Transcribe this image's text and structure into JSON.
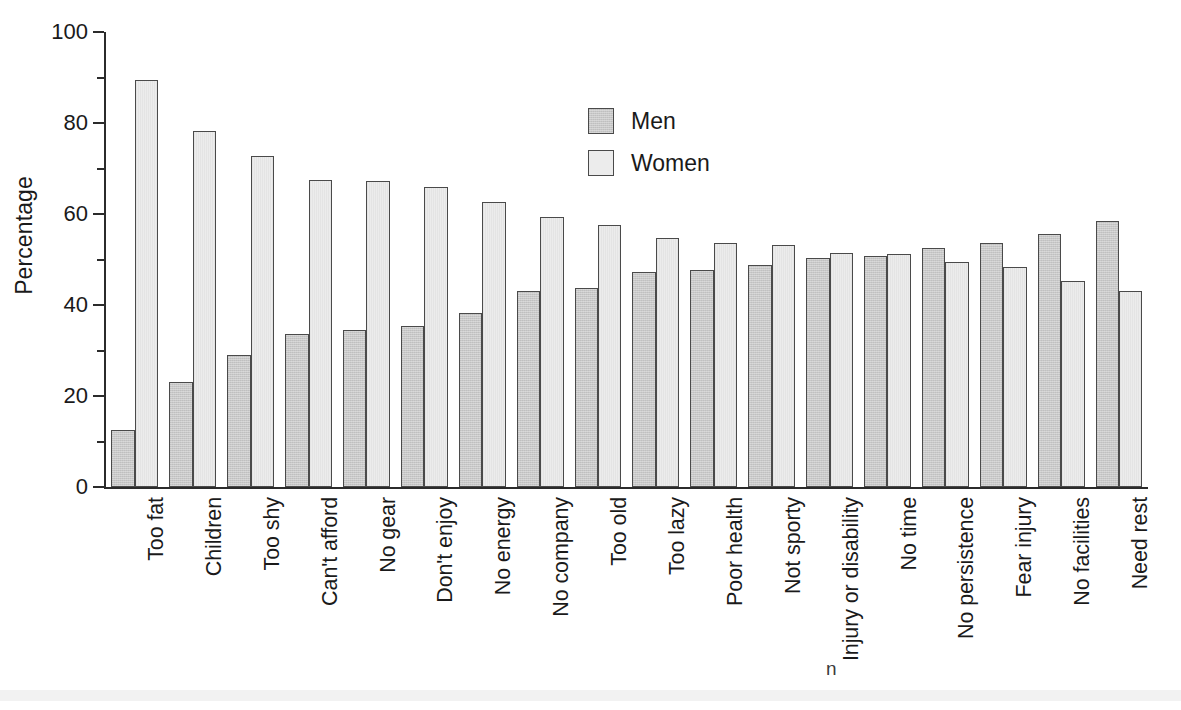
{
  "chart_data": {
    "type": "bar",
    "title": "",
    "subtitle": "",
    "xlabel": "",
    "ylabel": "Percentage",
    "ylim": [
      0,
      100
    ],
    "y_major_ticks": [
      0,
      20,
      40,
      60,
      80,
      100
    ],
    "y_minor_ticks": [
      10,
      30,
      50,
      70,
      90
    ],
    "y_tick_labels": [
      "0",
      "20",
      "40",
      "60",
      "80",
      "100"
    ],
    "grid": false,
    "legend_position": "inside-top-center",
    "orientation": "vertical",
    "grouping": "grouped",
    "categories": [
      "Too fat",
      "Children",
      "Too shy",
      "Can't afford",
      "No gear",
      "Don't enjoy",
      "No energy",
      "No company",
      "Too old",
      "Too lazy",
      "Poor health",
      "Not sporty",
      "Injury or disability",
      "No time",
      "No persistence",
      "Fear injury",
      "No facilities",
      "Need rest"
    ],
    "series": [
      {
        "name": "Men",
        "color": "#c8c8c8",
        "values": [
          12.6,
          23.0,
          29.0,
          33.6,
          34.4,
          35.3,
          38.2,
          43.1,
          43.7,
          47.2,
          47.7,
          48.8,
          50.3,
          50.7,
          52.5,
          53.7,
          55.7,
          58.4
        ]
      },
      {
        "name": "Women",
        "color": "#ececec",
        "values": [
          89.4,
          78.3,
          72.7,
          67.4,
          67.2,
          66.0,
          62.7,
          59.3,
          57.5,
          54.8,
          53.7,
          53.1,
          51.4,
          51.2,
          49.5,
          48.4,
          45.3,
          43.1
        ]
      }
    ],
    "annotations": []
  },
  "legend": {
    "items": [
      {
        "label": "Men",
        "swatch": "men"
      },
      {
        "label": "Women",
        "swatch": "women"
      }
    ]
  }
}
